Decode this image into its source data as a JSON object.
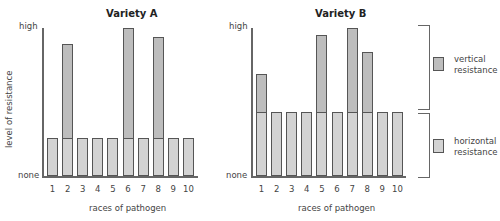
{
  "chart_data": [
    {
      "type": "bar",
      "stacked": true,
      "title": "Variety A",
      "xlabel": "races of pathogen",
      "ylabel": "level of resistance",
      "y_tick_labels": {
        "top": "high",
        "bottom": "none"
      },
      "ylim": [
        0,
        100
      ],
      "categories": [
        "1",
        "2",
        "3",
        "4",
        "5",
        "6",
        "7",
        "8",
        "9",
        "10"
      ],
      "series": [
        {
          "name": "horizontal resistance",
          "values": [
            26,
            26,
            26,
            26,
            26,
            26,
            26,
            26,
            26,
            26
          ]
        },
        {
          "name": "vertical resistance",
          "values": [
            0,
            63,
            0,
            0,
            0,
            74,
            0,
            68,
            0,
            0
          ]
        }
      ],
      "totals": [
        26,
        89,
        26,
        26,
        26,
        100,
        26,
        94,
        72,
        26
      ],
      "grid": false
    },
    {
      "type": "bar",
      "stacked": true,
      "title": "Variety B",
      "xlabel": "races of pathogen",
      "ylabel": "",
      "y_tick_labels": {
        "top": "high",
        "bottom": "none"
      },
      "ylim": [
        0,
        100
      ],
      "categories": [
        "1",
        "2",
        "3",
        "4",
        "5",
        "6",
        "7",
        "8",
        "9",
        "10"
      ],
      "series": [
        {
          "name": "horizontal resistance",
          "values": [
            43,
            43,
            43,
            43,
            43,
            43,
            43,
            43,
            43,
            43
          ]
        },
        {
          "name": "vertical resistance",
          "values": [
            26,
            0,
            0,
            0,
            52,
            0,
            57,
            41,
            0,
            0
          ]
        }
      ],
      "totals": [
        69,
        43,
        43,
        43,
        95,
        43,
        100,
        84,
        43,
        43
      ],
      "grid": false
    }
  ],
  "legend": {
    "items": [
      {
        "label_line1": "vertical",
        "label_line2": "resistance",
        "color": "#bdbdbd"
      },
      {
        "label_line1": "horizontal",
        "label_line2": "resistance",
        "color": "#d3d3d3"
      }
    ],
    "position": "right"
  },
  "axis_text": {
    "high": "high",
    "none": "none",
    "ylabel": "level of resistance",
    "xlabel": "races of pathogen",
    "titleA": "Variety A",
    "titleB": "Variety B",
    "ticks": [
      "1",
      "2",
      "3",
      "4",
      "5",
      "6",
      "7",
      "8",
      "9",
      "10"
    ]
  }
}
